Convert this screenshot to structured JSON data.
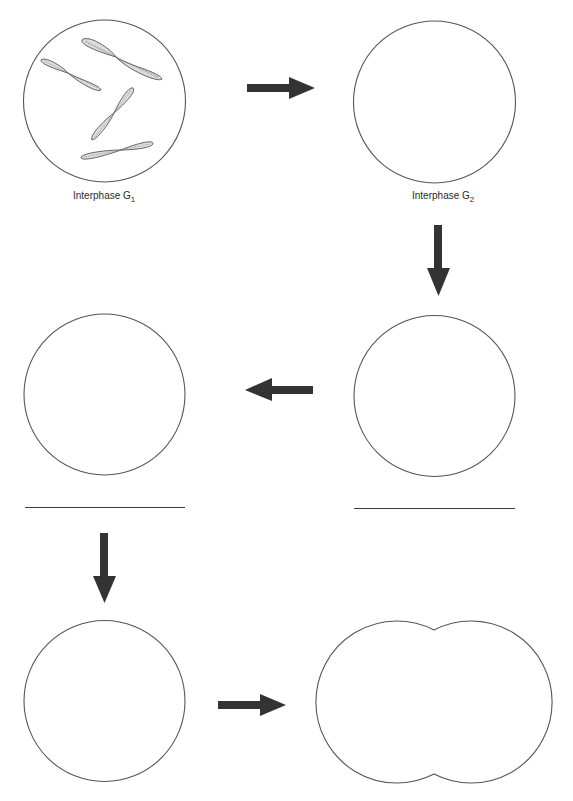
{
  "figure": {
    "type": "cell-cycle-worksheet",
    "colors": {
      "background": "#ffffff",
      "cell_outline": "#555555",
      "arrow": "#333333",
      "chromosome_fill": "#d8d8d8",
      "chromosome_outline": "#555555"
    }
  },
  "cells": [
    {
      "id": "cell-1",
      "label_main": "Interphase G",
      "label_sub": "1",
      "has_chromosomes": true,
      "answer_blank": false
    },
    {
      "id": "cell-2",
      "label_main": "Interphase G",
      "label_sub": "2",
      "has_chromosomes": false,
      "answer_blank": false
    },
    {
      "id": "cell-3",
      "label_main": "",
      "label_sub": "",
      "has_chromosomes": false,
      "answer_blank": true
    },
    {
      "id": "cell-4",
      "label_main": "",
      "label_sub": "",
      "has_chromosomes": false,
      "answer_blank": true
    },
    {
      "id": "cell-5",
      "label_main": "",
      "label_sub": "",
      "has_chromosomes": false,
      "answer_blank": false
    },
    {
      "id": "cell-6",
      "label_main": "",
      "label_sub": "",
      "has_chromosomes": false,
      "answer_blank": false,
      "shape": "dividing"
    }
  ],
  "arrows": [
    {
      "from": "cell-1",
      "to": "cell-2",
      "direction": "right"
    },
    {
      "from": "cell-2",
      "to": "cell-3",
      "direction": "down"
    },
    {
      "from": "cell-3",
      "to": "cell-4",
      "direction": "left"
    },
    {
      "from": "cell-4",
      "to": "cell-5",
      "direction": "down"
    },
    {
      "from": "cell-5",
      "to": "cell-6",
      "direction": "right"
    }
  ],
  "chromosome_count": 4
}
